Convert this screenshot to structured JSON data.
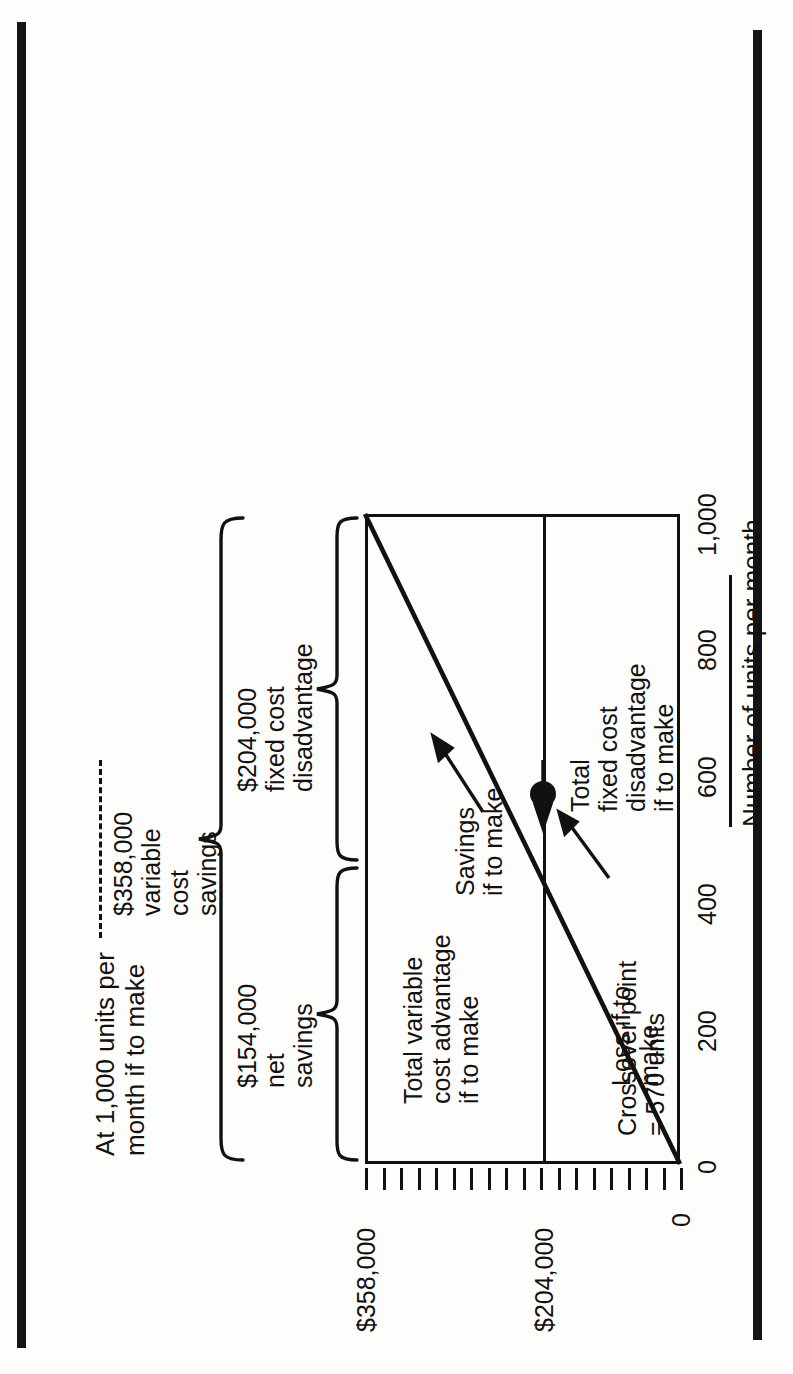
{
  "figure": {
    "header_note_line1": "At 1,000 units per",
    "header_note_line2": "month if to make",
    "source_note": "Source of data: Exhibit 9.4."
  },
  "braces": {
    "total": {
      "label_line1": "$358,000",
      "label_line2": "variable",
      "label_line3": "cost",
      "label_line4": "savings"
    },
    "net": {
      "label_line1": "$154,000",
      "label_line2": "net",
      "label_line3": "savings"
    },
    "fixed": {
      "label_line1": "$204,000",
      "label_line2": "fixed cost",
      "label_line3": "disadvantage"
    }
  },
  "annotations": {
    "total_variable_cost_advantage": {
      "line1": "Total variable",
      "line2": "cost advantage",
      "line3": "if to make"
    },
    "savings_if_to_make": {
      "line1": "Savings",
      "line2": "if to make"
    },
    "crossover": {
      "line1": "Crossover point",
      "line2": "= 570 units"
    },
    "loss_if_to_make": {
      "line1": "Loss if to",
      "line2": "make"
    },
    "total_fixed_cost_disadvantage": {
      "line1": "Total",
      "line2": "fixed cost",
      "line3": "disadvantage",
      "line4": "if to make"
    }
  },
  "chart_data": {
    "type": "line",
    "title": "",
    "xlabel": "Number of units per month",
    "ylabel": "",
    "xlim": [
      0,
      1000
    ],
    "ylim": [
      0,
      358000
    ],
    "xticks": [
      0,
      200,
      400,
      600,
      800,
      1000
    ],
    "xticklabels": [
      "0",
      "200",
      "400",
      "600",
      "800",
      "1,000"
    ],
    "yticklabels": [
      "0",
      "$204,000",
      "$358,000"
    ],
    "ytickvalues": [
      0,
      204000,
      358000
    ],
    "y_minor_tick_count": 19,
    "grid": false,
    "legend": null,
    "series": [
      {
        "name": "Total variable cost advantage if to make",
        "x": [
          0,
          1000
        ],
        "values": [
          0,
          358000
        ]
      }
    ],
    "reference_lines": [
      {
        "name": "total fixed cost disadvantage",
        "orientation": "horizontal",
        "value": 204000
      }
    ],
    "markers": [
      {
        "name": "crossover point",
        "x": 570,
        "y": 204000,
        "label": "Crossover point = 570 units"
      }
    ],
    "annotations": [
      {
        "text": "Total variable cost advantage if to make",
        "points_to": "slope-line"
      },
      {
        "text": "Savings if to make",
        "region": "between 204,000 line and slope line, right of crossover"
      },
      {
        "text": "Loss if to make",
        "region": "below slope line, left of crossover"
      },
      {
        "text": "Total fixed cost disadvantage if to make",
        "points_to": "204,000 line"
      },
      {
        "text": "$154,000 net savings",
        "brace_span": "204,000 to 358,000"
      },
      {
        "text": "$204,000 fixed cost disadvantage",
        "brace_span": "0 to 204,000"
      },
      {
        "text": "$358,000 variable cost savings",
        "brace_span": "0 to 358,000"
      },
      {
        "text": "At 1,000 units per month if to make",
        "role": "header note"
      }
    ]
  },
  "ticks": {
    "x": [
      "0",
      "200",
      "400",
      "600",
      "800",
      "1,000"
    ],
    "y_labels": {
      "top": "$358,000",
      "mid": "$204,000",
      "bottom": "0"
    }
  }
}
